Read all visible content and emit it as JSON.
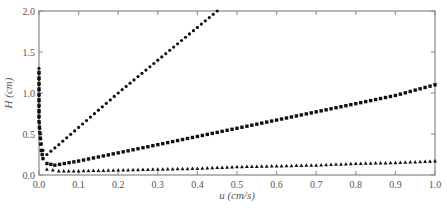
{
  "chart_data": {
    "type": "scatter",
    "title": "",
    "xlabel": "u (cm/s)",
    "ylabel": "H (cm)",
    "xlim": [
      0.0,
      1.0
    ],
    "ylim": [
      0.0,
      2.0
    ],
    "xticks": [
      "0.0",
      "0.1",
      "0.2",
      "0.3",
      "0.4",
      "0.5",
      "0.6",
      "0.7",
      "0.8",
      "0.9",
      "1.0"
    ],
    "yticks": [
      "0.0",
      "0.5",
      "1.0",
      "1.5",
      "2.0"
    ],
    "grid": false,
    "legend": null,
    "series": [
      {
        "name": "series-1 (dots, steep)",
        "marker": "circle",
        "x": [
          0.0,
          0.0,
          0.003,
          0.006,
          0.01,
          0.02,
          0.05,
          0.1,
          0.15,
          0.2,
          0.25,
          0.3,
          0.35,
          0.4,
          0.45
        ],
        "y": [
          1.3,
          0.7,
          0.5,
          0.38,
          0.3,
          0.25,
          0.37,
          0.58,
          0.79,
          1.0,
          1.2,
          1.4,
          1.6,
          1.8,
          2.0
        ]
      },
      {
        "name": "series-2 (squares)",
        "marker": "square",
        "x": [
          0.0,
          0.0,
          0.003,
          0.006,
          0.01,
          0.02,
          0.04,
          0.1,
          0.2,
          0.3,
          0.4,
          0.5,
          0.6,
          0.7,
          0.8,
          0.9,
          1.0
        ],
        "y": [
          1.25,
          0.65,
          0.45,
          0.3,
          0.2,
          0.14,
          0.12,
          0.17,
          0.27,
          0.37,
          0.47,
          0.57,
          0.67,
          0.77,
          0.87,
          0.97,
          1.1
        ]
      },
      {
        "name": "series-3 (triangles)",
        "marker": "triangle",
        "x": [
          0.02,
          0.05,
          0.1,
          0.2,
          0.3,
          0.4,
          0.5,
          0.6,
          0.7,
          0.8,
          0.9,
          1.0
        ],
        "y": [
          0.07,
          0.05,
          0.05,
          0.06,
          0.07,
          0.08,
          0.1,
          0.11,
          0.12,
          0.14,
          0.15,
          0.17
        ]
      }
    ]
  }
}
